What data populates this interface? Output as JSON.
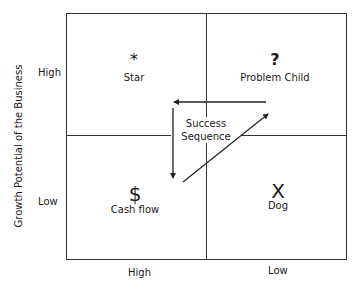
{
  "diagram": {
    "y_axis": {
      "title": "Growth Potential of the Business",
      "high_label": "High",
      "low_label": "Low"
    },
    "x_axis": {
      "high_label": "High",
      "low_label": "Low"
    },
    "quadrants": {
      "top_left": {
        "symbol": "*",
        "icon": "asterisk-icon",
        "label": "Star"
      },
      "top_right": {
        "symbol": "?",
        "icon": "question-mark-icon",
        "label": "Problem Child"
      },
      "bottom_left": {
        "symbol": "$",
        "icon": "dollar-sign-icon",
        "label": "Cash flow"
      },
      "bottom_right": {
        "symbol": "X",
        "icon": "x-icon",
        "label": "Dog"
      }
    },
    "center": {
      "line1": "Success",
      "line2": "Sequence"
    },
    "colors": {
      "line": "#333333",
      "text": "#1a1a1a",
      "background": "#ffffff"
    }
  }
}
